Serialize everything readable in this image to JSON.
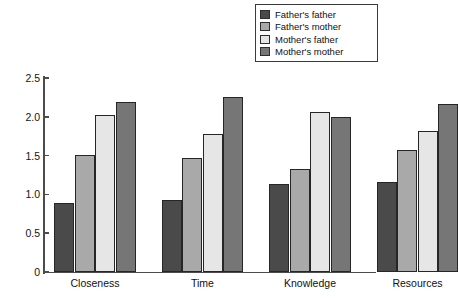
{
  "chart_data": {
    "type": "bar",
    "title": "",
    "subtitle": "",
    "xlabel": "",
    "ylabel": "",
    "categories": [
      "Closeness",
      "Time",
      "Knowledge",
      "Resources"
    ],
    "series": [
      {
        "name": "Father's father",
        "color": "#4a4a4a",
        "values": [
          0.89,
          0.93,
          1.14,
          1.16
        ]
      },
      {
        "name": "Father's mother",
        "color": "#a9a9a9",
        "values": [
          1.51,
          1.47,
          1.33,
          1.57
        ]
      },
      {
        "name": "Mother's father",
        "color": "#e6e6e6",
        "values": [
          2.02,
          1.78,
          2.06,
          1.82
        ]
      },
      {
        "name": "Mother's mother",
        "color": "#767676",
        "values": [
          2.19,
          2.25,
          2.0,
          2.16
        ]
      }
    ],
    "ylim": [
      0,
      2.5
    ],
    "yticks": [
      0,
      0.5,
      1.0,
      1.5,
      2.0,
      2.5
    ],
    "ytick_labels": [
      "0",
      "0.5",
      "1.0",
      "1.5",
      "2.0",
      "2.5"
    ],
    "grid": false,
    "legend_position": "top-right"
  },
  "legend": {
    "items": [
      {
        "label": "Father's father"
      },
      {
        "label": "Father's mother"
      },
      {
        "label": "Mother's father"
      },
      {
        "label": "Mother's mother"
      }
    ]
  },
  "axes": {
    "y_ticks": [
      {
        "label": "2.5",
        "value": 2.5
      },
      {
        "label": "2.0",
        "value": 2.0
      },
      {
        "label": "1.5",
        "value": 1.5
      },
      {
        "label": "1.0",
        "value": 1.0
      },
      {
        "label": "0.5",
        "value": 0.5
      },
      {
        "label": "0",
        "value": 0
      }
    ],
    "x_categories": [
      "Closeness",
      "Time",
      "Knowledge",
      "Resources"
    ]
  }
}
